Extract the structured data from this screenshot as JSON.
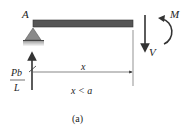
{
  "diagram": {
    "labels": {
      "point_a": "A",
      "moment": "M",
      "shear": "V",
      "reaction_num": "Pb",
      "reaction_den": "L",
      "distance": "x",
      "condition": "x < a",
      "caption": "(a)"
    },
    "colors": {
      "beam": "#555555",
      "support": "#8a8a8a",
      "ground": "#bfbfbf",
      "arrow": "#333333",
      "line": "#555555"
    }
  }
}
